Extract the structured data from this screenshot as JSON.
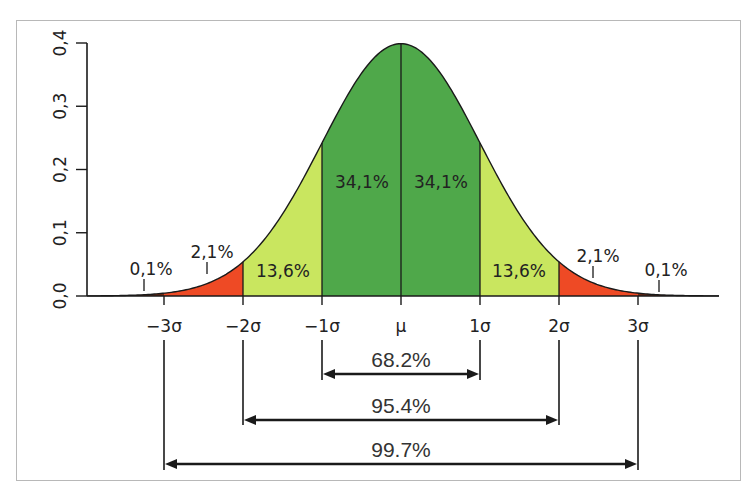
{
  "chart_data": {
    "type": "area",
    "title": "",
    "xlabel": "",
    "ylabel": "",
    "ylim": [
      0.0,
      0.4
    ],
    "y_ticks": [
      "0,0",
      "0,1",
      "0,2",
      "0,3",
      "0,4"
    ],
    "y_tick_values": [
      0.0,
      0.1,
      0.2,
      0.3,
      0.4
    ],
    "x_ticks": [
      "−3σ",
      "−2σ",
      "−1σ",
      "μ",
      "1σ",
      "2σ",
      "3σ"
    ],
    "x_tick_values": [
      -3,
      -2,
      -1,
      0,
      1,
      2,
      3
    ],
    "grid": false,
    "legend": null,
    "bands": [
      {
        "from": -3,
        "to": -2,
        "label": "2,1%",
        "color": "#ee4a25"
      },
      {
        "from": -2,
        "to": -1,
        "label": "13,6%",
        "color": "#c9e65f"
      },
      {
        "from": -1,
        "to": 0,
        "label": "34,1%",
        "color": "#4fa84a"
      },
      {
        "from": 0,
        "to": 1,
        "label": "34,1%",
        "color": "#4fa84a"
      },
      {
        "from": 1,
        "to": 2,
        "label": "13,6%",
        "color": "#c9e65f"
      },
      {
        "from": 2,
        "to": 3,
        "label": "2,1%",
        "color": "#ee4a25"
      }
    ],
    "tail_labels": [
      {
        "side": "left",
        "label": "0,1%"
      },
      {
        "side": "right",
        "label": "0,1%"
      }
    ],
    "ranges": [
      {
        "from": -1,
        "to": 1,
        "label": "68.2%"
      },
      {
        "from": -2,
        "to": 2,
        "label": "95.4%"
      },
      {
        "from": -3,
        "to": 3,
        "label": "99.7%"
      }
    ],
    "curve_points": {
      "x": [
        -3,
        -2.5,
        -2,
        -1.5,
        -1,
        -0.5,
        0,
        0.5,
        1,
        1.5,
        2,
        2.5,
        3
      ],
      "y": [
        0.0044,
        0.0175,
        0.054,
        0.1295,
        0.242,
        0.3521,
        0.3989,
        0.3521,
        0.242,
        0.1295,
        0.054,
        0.0175,
        0.0044
      ]
    }
  },
  "colors": {
    "tail": "#ee4a25",
    "mid": "#c9e65f",
    "center": "#4fa84a",
    "line": "#1a1a1a"
  }
}
